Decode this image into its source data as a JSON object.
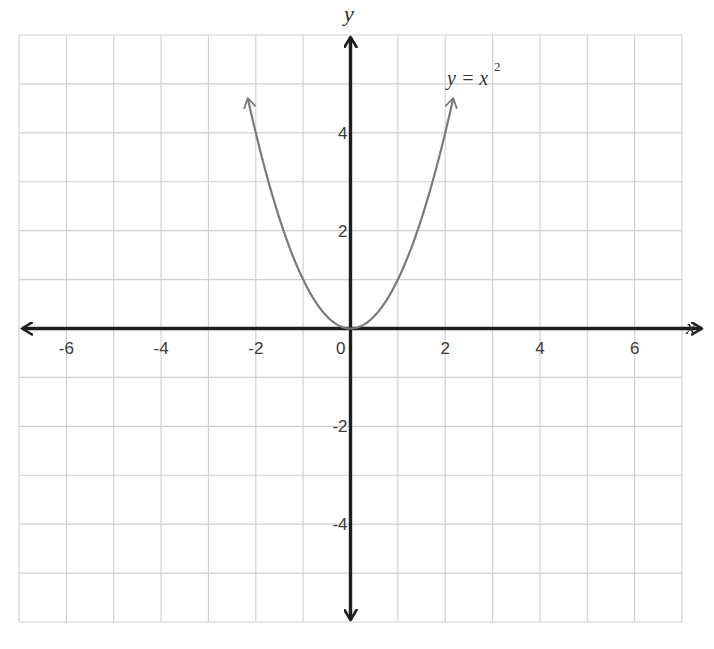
{
  "chart_data": {
    "type": "line",
    "title": "",
    "xlabel": "x",
    "ylabel": "y",
    "xlim": [
      -7,
      7
    ],
    "ylim": [
      -6,
      6
    ],
    "grid": true,
    "x_ticks": [
      -6,
      -4,
      -2,
      0,
      2,
      4,
      6
    ],
    "x_tick_labels": [
      "-6",
      "-4",
      "-2",
      "0",
      "2",
      "4",
      "6"
    ],
    "y_ticks": [
      4,
      2,
      -2,
      -4
    ],
    "y_tick_labels": [
      "4",
      "2",
      "-2",
      "-4"
    ],
    "legend": null,
    "series": [
      {
        "name": "y = x^2",
        "label_text": "y = x",
        "label_superscript": "2",
        "function": "x^2",
        "x_range": [
          -2.17,
          2.17
        ],
        "x": [
          -2.17,
          -2,
          -1.5,
          -1,
          -0.5,
          0,
          0.5,
          1,
          1.5,
          2,
          2.17
        ],
        "y": [
          4.7,
          4,
          2.25,
          1,
          0.25,
          0,
          0.25,
          1,
          2.25,
          4,
          4.7
        ],
        "arrows_at_ends": true,
        "color": "#7a7a7a"
      }
    ],
    "annotations": [
      {
        "text": "y = x²",
        "x": 2.1,
        "y": 5.0
      }
    ]
  },
  "colors": {
    "grid": "#cfcfcf",
    "axes": "#1e1e1e",
    "curve": "#7a7a7a",
    "text": "#3a3a3a",
    "background": "#ffffff"
  },
  "labels": {
    "x_axis": "x",
    "y_axis": "y",
    "curve_main": "y = x",
    "curve_sup": "2"
  }
}
